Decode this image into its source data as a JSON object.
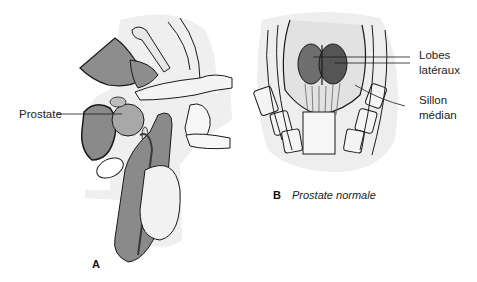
{
  "figure": {
    "panel_a": {
      "letter": "A",
      "labels": {
        "prostate": "Prostate"
      }
    },
    "panel_b": {
      "letter": "B",
      "caption": "Prostate normale",
      "labels": {
        "lobes_line1": "Lobes",
        "lobes_line2": "latéraux",
        "sillon_line1": "Sillon",
        "sillon_line2": "médian"
      }
    },
    "colors": {
      "background": "#ffffff",
      "organ_gray": "#8a8a8a",
      "organ_dark": "#5a5a5a",
      "tissue_light": "#ececec",
      "line": "#1a1a1a"
    }
  }
}
